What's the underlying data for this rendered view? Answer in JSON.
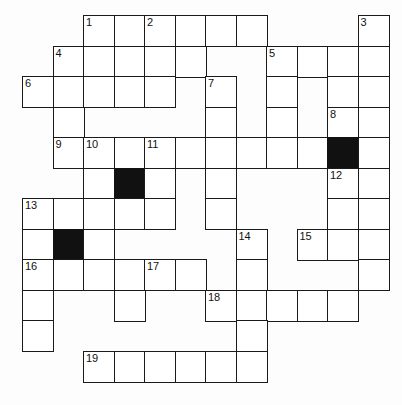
{
  "puzzle": {
    "title": "Crossword Grid",
    "grid": {
      "columns": 12,
      "rows": 12,
      "cell_size": 30.5,
      "origin_x": 22,
      "origin_y": 15,
      "border_color": "#1a1a1a",
      "cell_color": "#ffffff",
      "block_color": "#111111",
      "background_color": "#fdfdfd"
    },
    "cells": [
      {
        "r": 0,
        "c": 2,
        "num": "1"
      },
      {
        "r": 0,
        "c": 3,
        "num": ""
      },
      {
        "r": 0,
        "c": 4,
        "num": "2"
      },
      {
        "r": 0,
        "c": 5,
        "num": ""
      },
      {
        "r": 0,
        "c": 6,
        "num": ""
      },
      {
        "r": 0,
        "c": 7,
        "num": ""
      },
      {
        "r": 0,
        "c": 11,
        "num": "3"
      },
      {
        "r": 1,
        "c": 1,
        "num": "4"
      },
      {
        "r": 1,
        "c": 2,
        "num": ""
      },
      {
        "r": 1,
        "c": 3,
        "num": ""
      },
      {
        "r": 1,
        "c": 4,
        "num": ""
      },
      {
        "r": 1,
        "c": 5,
        "num": ""
      },
      {
        "r": 1,
        "c": 8,
        "num": "5"
      },
      {
        "r": 1,
        "c": 9,
        "num": ""
      },
      {
        "r": 1,
        "c": 10,
        "num": ""
      },
      {
        "r": 1,
        "c": 11,
        "num": ""
      },
      {
        "r": 2,
        "c": 0,
        "num": "6"
      },
      {
        "r": 2,
        "c": 1,
        "num": ""
      },
      {
        "r": 2,
        "c": 2,
        "num": ""
      },
      {
        "r": 2,
        "c": 3,
        "num": ""
      },
      {
        "r": 2,
        "c": 4,
        "num": ""
      },
      {
        "r": 2,
        "c": 6,
        "num": "7"
      },
      {
        "r": 2,
        "c": 8,
        "num": ""
      },
      {
        "r": 2,
        "c": 10,
        "num": ""
      },
      {
        "r": 2,
        "c": 11,
        "num": ""
      },
      {
        "r": 3,
        "c": 1,
        "num": ""
      },
      {
        "r": 3,
        "c": 6,
        "num": ""
      },
      {
        "r": 3,
        "c": 8,
        "num": ""
      },
      {
        "r": 3,
        "c": 10,
        "num": "8"
      },
      {
        "r": 3,
        "c": 11,
        "num": ""
      },
      {
        "r": 4,
        "c": 1,
        "num": "9"
      },
      {
        "r": 4,
        "c": 2,
        "num": "10"
      },
      {
        "r": 4,
        "c": 3,
        "num": ""
      },
      {
        "r": 4,
        "c": 4,
        "num": "11"
      },
      {
        "r": 4,
        "c": 5,
        "num": ""
      },
      {
        "r": 4,
        "c": 6,
        "num": ""
      },
      {
        "r": 4,
        "c": 7,
        "num": ""
      },
      {
        "r": 4,
        "c": 8,
        "num": ""
      },
      {
        "r": 4,
        "c": 9,
        "num": ""
      },
      {
        "r": 4,
        "c": 10,
        "num": "",
        "block": true
      },
      {
        "r": 4,
        "c": 11,
        "num": ""
      },
      {
        "r": 5,
        "c": 2,
        "num": ""
      },
      {
        "r": 5,
        "c": 3,
        "num": "",
        "block": true
      },
      {
        "r": 5,
        "c": 4,
        "num": ""
      },
      {
        "r": 5,
        "c": 6,
        "num": ""
      },
      {
        "r": 5,
        "c": 10,
        "num": "12"
      },
      {
        "r": 5,
        "c": 11,
        "num": ""
      },
      {
        "r": 6,
        "c": 0,
        "num": "13"
      },
      {
        "r": 6,
        "c": 1,
        "num": ""
      },
      {
        "r": 6,
        "c": 2,
        "num": ""
      },
      {
        "r": 6,
        "c": 3,
        "num": ""
      },
      {
        "r": 6,
        "c": 4,
        "num": ""
      },
      {
        "r": 6,
        "c": 6,
        "num": ""
      },
      {
        "r": 6,
        "c": 10,
        "num": ""
      },
      {
        "r": 6,
        "c": 11,
        "num": ""
      },
      {
        "r": 7,
        "c": 0,
        "num": ""
      },
      {
        "r": 7,
        "c": 1,
        "num": "",
        "block": true
      },
      {
        "r": 7,
        "c": 2,
        "num": ""
      },
      {
        "r": 7,
        "c": 7,
        "num": "14"
      },
      {
        "r": 7,
        "c": 9,
        "num": "15"
      },
      {
        "r": 7,
        "c": 10,
        "num": ""
      },
      {
        "r": 7,
        "c": 11,
        "num": ""
      },
      {
        "r": 8,
        "c": 0,
        "num": "16"
      },
      {
        "r": 8,
        "c": 1,
        "num": ""
      },
      {
        "r": 8,
        "c": 2,
        "num": ""
      },
      {
        "r": 8,
        "c": 3,
        "num": ""
      },
      {
        "r": 8,
        "c": 4,
        "num": "17"
      },
      {
        "r": 8,
        "c": 5,
        "num": ""
      },
      {
        "r": 8,
        "c": 7,
        "num": ""
      },
      {
        "r": 8,
        "c": 11,
        "num": ""
      },
      {
        "r": 9,
        "c": 0,
        "num": ""
      },
      {
        "r": 9,
        "c": 3,
        "num": ""
      },
      {
        "r": 9,
        "c": 6,
        "num": "18"
      },
      {
        "r": 9,
        "c": 7,
        "num": ""
      },
      {
        "r": 9,
        "c": 8,
        "num": ""
      },
      {
        "r": 9,
        "c": 9,
        "num": ""
      },
      {
        "r": 9,
        "c": 10,
        "num": ""
      },
      {
        "r": 10,
        "c": 0,
        "num": ""
      },
      {
        "r": 10,
        "c": 7,
        "num": ""
      },
      {
        "r": 11,
        "c": 2,
        "num": "19"
      },
      {
        "r": 11,
        "c": 3,
        "num": ""
      },
      {
        "r": 11,
        "c": 4,
        "num": ""
      },
      {
        "r": 11,
        "c": 5,
        "num": ""
      },
      {
        "r": 11,
        "c": 6,
        "num": ""
      },
      {
        "r": 11,
        "c": 7,
        "num": ""
      }
    ]
  }
}
